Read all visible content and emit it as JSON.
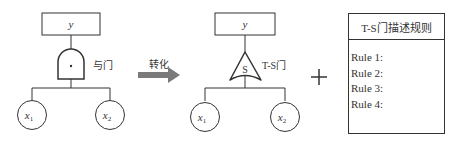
{
  "left_tree": {
    "top_event": "y",
    "gate_label": "与门",
    "gate_symbol": "·",
    "inputs": [
      "x1",
      "x2"
    ],
    "input_labels": [
      {
        "base": "x",
        "sub": "1"
      },
      {
        "base": "x",
        "sub": "2"
      }
    ]
  },
  "arrow": {
    "label": "转化",
    "color": "#7a7a7a"
  },
  "right_tree": {
    "top_event": "y",
    "gate_label": "T-S门",
    "gate_symbol": "S",
    "inputs": [
      "x1",
      "x2"
    ],
    "input_labels": [
      {
        "base": "x",
        "sub": "1"
      },
      {
        "base": "x",
        "sub": "2"
      }
    ]
  },
  "plus_symbol": "+",
  "rules_box": {
    "title": "T-S门描述规则",
    "rules": [
      "Rule 1:",
      "Rule 2:",
      "Rule 3:",
      "Rule 4:"
    ]
  }
}
